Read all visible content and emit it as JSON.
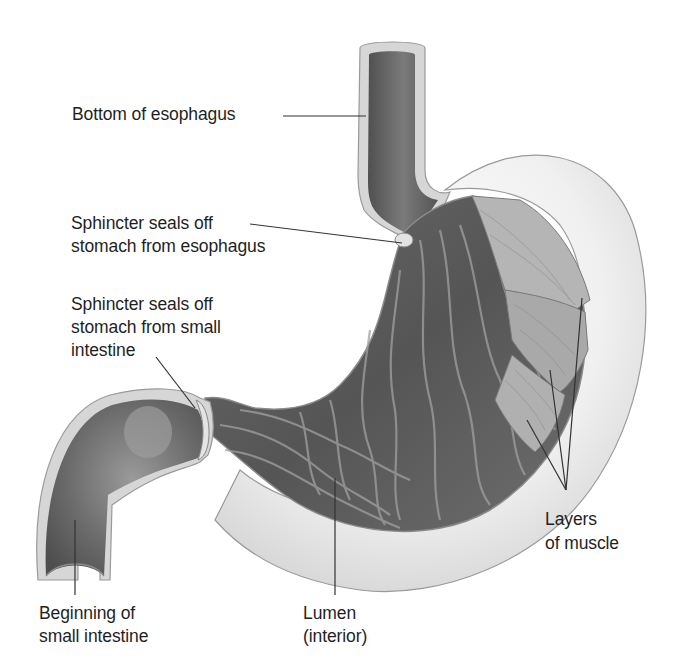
{
  "diagram": {
    "colors": {
      "background": "#ffffff",
      "outer_wall": "#dcdcdc",
      "outer_wall_light": "#f2f2f2",
      "lumen_dark": "#5c5c5c",
      "lumen_mid": "#7a7a7a",
      "fold_highlight": "#9a9a9a",
      "muscle_layer": "#a8a8a8",
      "leader_line": "#333333",
      "label_text": "#1f1f1f"
    },
    "labels": {
      "esophagus_bottom": "Bottom of esophagus",
      "upper_sphincter_1": "Sphincter seals off",
      "upper_sphincter_2": "stomach from esophagus",
      "lower_sphincter_1": "Sphincter seals off",
      "lower_sphincter_2": "stomach from small",
      "lower_sphincter_3": "intestine",
      "small_intestine_1": "Beginning of",
      "small_intestine_2": "small intestine",
      "lumen_1": "Lumen",
      "lumen_2": "(interior)",
      "muscle_1": "Layers",
      "muscle_2": "of muscle"
    },
    "structures": [
      "esophagus",
      "upper-sphincter",
      "stomach-body",
      "muscle-layers",
      "lower-sphincter",
      "small-intestine",
      "lumen"
    ]
  }
}
